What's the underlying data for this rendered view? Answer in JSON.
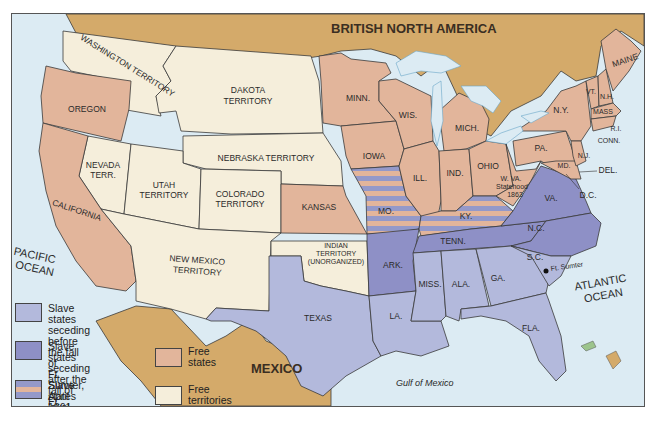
{
  "title_labels": {
    "british_north_america": "BRITISH NORTH AMERICA",
    "mexico": "MEXICO",
    "pacific_ocean": [
      "PACIFIC",
      "OCEAN"
    ],
    "atlantic_ocean": [
      "ATLANTIC",
      "OCEAN"
    ],
    "gulf_of_mexico": "Gulf of Mexico",
    "fort_sumter": "Ft. Sumter"
  },
  "colors": {
    "free_states": "#e2b59b",
    "free_territories": "#f5eedb",
    "slave_before": "#b3b9dc",
    "slave_after": "#8e90c6",
    "slave_loyal_stripe_a": "#e2b59b",
    "slave_loyal_stripe_b": "#9499c9",
    "foreign_land": "#d4aa6a",
    "water": "#dcebf3"
  },
  "regions": {
    "washington_territory": "WASHINGTON TERRITORY",
    "oregon": "OREGON",
    "california": "CALIFORNIA",
    "nevada": [
      "NEVADA",
      "TERR."
    ],
    "utah": [
      "UTAH",
      "TERRITORY"
    ],
    "colorado": [
      "COLORADO",
      "TERRITORY"
    ],
    "dakota": [
      "DAKOTA",
      "TERRITORY"
    ],
    "nebraska": "NEBRASKA TERRITORY",
    "new_mexico": [
      "NEW MEXICO",
      "TERRITORY"
    ],
    "kansas": "KANSAS",
    "indian_territory": [
      "INDIAN",
      "TERRITORY",
      "(UNORGANIZED)"
    ],
    "texas": "TEXAS",
    "minn": "MINN.",
    "iowa": "IOWA",
    "mo": "MO.",
    "ark": "ARK.",
    "la": "LA.",
    "wis": "WIS.",
    "ill": "ILL.",
    "mich": "MICH.",
    "ind": "IND.",
    "ohio": "OHIO",
    "ky": "KY.",
    "tenn": "TENN.",
    "miss": "MISS.",
    "ala": "ALA.",
    "ga": "GA.",
    "fla": "FLA.",
    "sc": "S.C.",
    "nc": "N.C.",
    "va": "VA.",
    "wva": [
      "W. VA.",
      "Statehood",
      "1863"
    ],
    "pa": "PA.",
    "ny": "N.Y.",
    "md": "MD.",
    "del": "DEL.",
    "dc": "D.C.",
    "nj": "N.J.",
    "conn": "CONN.",
    "ri": "R.I.",
    "mass": "MASS",
    "vt": "VT.",
    "nh": "N.H.",
    "maine": "MAINE"
  },
  "legend": {
    "items": [
      {
        "key": "slave_before",
        "lines": [
          "Slave states seceding",
          "before the fall of",
          "Ft. Sumter, April 1861"
        ]
      },
      {
        "key": "slave_after",
        "lines": [
          "Slave states seceding",
          "after the fall of",
          "Ft. Sumter, April 1861"
        ]
      },
      {
        "key": "slave_loyal",
        "lines": [
          "Slave states loyal",
          "to the Union"
        ]
      },
      {
        "key": "free_states",
        "lines": [
          "Free states"
        ]
      },
      {
        "key": "free_territories",
        "lines": [
          "Free territories"
        ]
      }
    ]
  }
}
